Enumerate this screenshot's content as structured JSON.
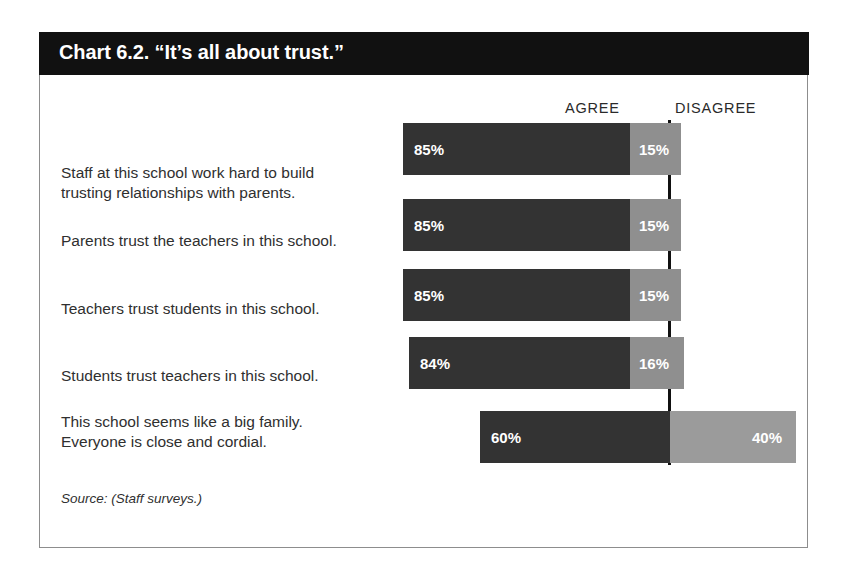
{
  "card": {
    "title": "Chart 6.2. “It’s all about trust.”",
    "source": "Source: (Staff surveys.)"
  },
  "headers": {
    "agree": "AGREE",
    "disagree": "DISAGREE"
  },
  "colors": {
    "agree_bar": "#333333",
    "disagree_bar": "#8f8f8f",
    "disagree_bar_light": "#9b9b9b",
    "title_bar": "#111111",
    "divider": "#111111",
    "card_border": "#8d8d8d",
    "text": "#2f2f2f",
    "bar_label_text": "#ffffff"
  },
  "chart_data": {
    "type": "bar",
    "title": "Chart 6.2. “It’s all about trust.”",
    "subtitle": "",
    "xlabel": "",
    "ylabel": "",
    "orientation": "horizontal",
    "stacked": true,
    "grid": false,
    "legend_position": "top",
    "xlim": [
      0,
      100
    ],
    "legend": [
      "AGREE",
      "DISAGREE"
    ],
    "categories": [
      "Staff at this school work hard to build trusting relationships with parents.",
      "Parents trust the teachers in this school.",
      "Teachers trust students in this school.",
      "Students trust teachers in this school.",
      "This school seems like a big family. Everyone is close and cordial."
    ],
    "series": [
      {
        "name": "AGREE",
        "values": [
          85,
          85,
          85,
          84,
          60
        ]
      },
      {
        "name": "DISAGREE",
        "values": [
          15,
          15,
          15,
          16,
          40
        ]
      }
    ],
    "value_labels": {
      "agree": [
        "85%",
        "85%",
        "85%",
        "84%",
        "60%"
      ],
      "disagree": [
        "15%",
        "15%",
        "15%",
        "16%",
        "40%"
      ]
    }
  },
  "rows": [
    {
      "label": "Staff at this school work hard to build\ntrusting relationships with parents.",
      "label_top": 130,
      "bar_top": 90,
      "bar_left": 363,
      "agree_width": 227,
      "disagree_width": 51,
      "agree_label": "85%",
      "disagree_label": "15%",
      "disagree_wide": false
    },
    {
      "label": "Parents trust the teachers in this school.",
      "label_top": 198,
      "bar_top": 166,
      "bar_left": 363,
      "agree_width": 227,
      "disagree_width": 51,
      "agree_label": "85%",
      "disagree_label": "15%",
      "disagree_wide": false
    },
    {
      "label": "Teachers trust students in this school.",
      "label_top": 266,
      "bar_top": 236,
      "bar_left": 363,
      "agree_width": 227,
      "disagree_width": 51,
      "agree_label": "85%",
      "disagree_label": "15%",
      "disagree_wide": false
    },
    {
      "label": "Students trust teachers in this school.",
      "label_top": 333,
      "bar_top": 304,
      "bar_left": 369,
      "agree_width": 221,
      "disagree_width": 54,
      "agree_label": "84%",
      "disagree_label": "16%",
      "disagree_wide": false
    },
    {
      "label": "This school seems like a big family.\nEveryone is close and cordial.",
      "label_top": 379,
      "bar_top": 378,
      "bar_left": 440,
      "agree_width": 190,
      "disagree_width": 126,
      "agree_label": "60%",
      "disagree_label": "40%",
      "disagree_wide": true
    }
  ]
}
